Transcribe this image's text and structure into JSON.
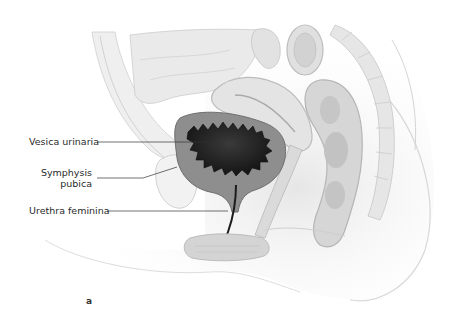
{
  "figure": {
    "panel_letter": "a",
    "labels": [
      {
        "id": "vesica-urinaria",
        "text": "Vesica urinaria"
      },
      {
        "id": "symphysis-pubica",
        "text_lines": [
          "Symphysis",
          "pubica"
        ]
      },
      {
        "id": "urethra-feminina",
        "text": "Urethra feminina"
      }
    ],
    "colors": {
      "background": "#ffffff",
      "tissue_light": "#ececec",
      "tissue_mid": "#d4d4d4",
      "tissue_dark": "#b8b8b8",
      "bladder_wall": "#8e8e8e",
      "bladder_lumen": "#1e1e1e",
      "leader_line": "#333333"
    }
  }
}
